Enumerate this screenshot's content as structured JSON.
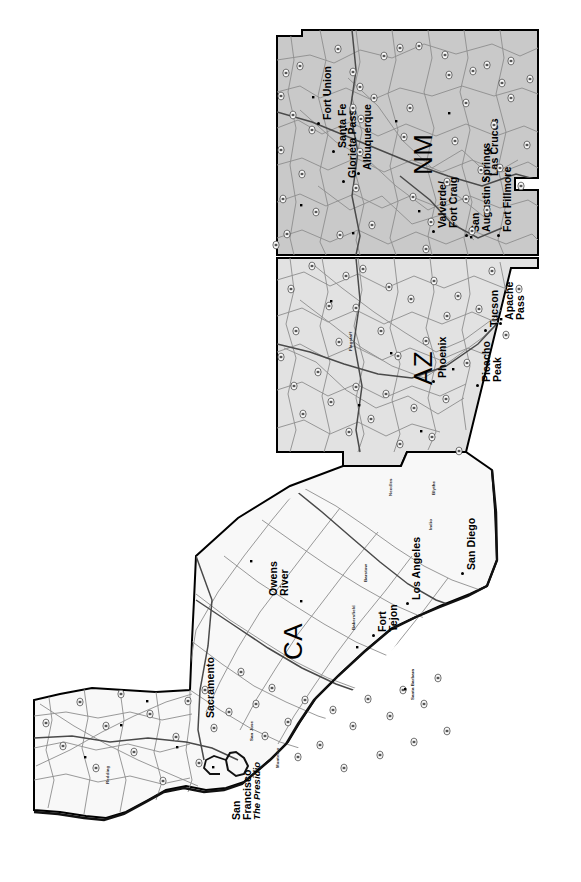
{
  "map": {
    "title": "Southwest States Historic Route Map",
    "projection_note": "rotated 90 degrees counter-clockwise",
    "background_color": "#ffffff",
    "colors": {
      "new_mexico_fill": "#c9c9c9",
      "arizona_fill": "#e2e2e2",
      "california_fill": "#f7f7f7",
      "state_border": "#000000",
      "road": "#8d8d8d",
      "major_road": "#4a4a4a",
      "shield_fill": "#ffffff",
      "label_color": "#000000"
    },
    "states": [
      {
        "code": "NM",
        "name": "New Mexico",
        "label": "NM",
        "fill": "#c9c9c9"
      },
      {
        "code": "AZ",
        "name": "Arizona",
        "label": "AZ",
        "fill": "#e2e2e2"
      },
      {
        "code": "CA",
        "name": "California",
        "label": "CA",
        "fill": "#f7f7f7"
      }
    ],
    "state_labels": [
      {
        "id": "nm-label",
        "text": "NM",
        "x": 410,
        "y": 175
      },
      {
        "id": "az-label",
        "text": "AZ",
        "x": 410,
        "y": 385
      },
      {
        "id": "ca-label",
        "text": "CA",
        "x": 280,
        "y": 660
      }
    ],
    "city_labels": [
      {
        "id": "fort-union",
        "text": "Fort Union",
        "state": "NM",
        "x": 322,
        "y": 120,
        "marker": true
      },
      {
        "id": "santa-fe",
        "text": "Santa Fe",
        "state": "NM",
        "x": 337,
        "y": 148,
        "marker": true
      },
      {
        "id": "glorieta-pass",
        "text": "Glorieta Pass",
        "state": "NM",
        "x": 347,
        "y": 178,
        "marker": true
      },
      {
        "id": "albuquerque",
        "text": "Albuquerque",
        "state": "NM",
        "x": 362,
        "y": 170,
        "marker": true
      },
      {
        "id": "valverde-fort-craig",
        "text": "Valverde/",
        "text2": "Fort Craig",
        "state": "NM",
        "x": 437,
        "y": 228,
        "marker": true
      },
      {
        "id": "san-augustin-springs",
        "text": "San",
        "text2": "Augustin Springs",
        "state": "NM",
        "x": 470,
        "y": 232,
        "marker": true
      },
      {
        "id": "las-cruces",
        "text": "Las Cruces",
        "state": "NM",
        "x": 489,
        "y": 176,
        "marker": true
      },
      {
        "id": "fort-fillmore",
        "text": "Fort Fillmore",
        "state": "NM",
        "x": 502,
        "y": 232,
        "marker": true
      },
      {
        "id": "flagstaff",
        "text": "Flagstaff",
        "state": "AZ",
        "x": 349,
        "y": 351,
        "minor": true
      },
      {
        "id": "phoenix",
        "text": "Phoenix",
        "state": "AZ",
        "x": 437,
        "y": 378,
        "marker": true
      },
      {
        "id": "tucson",
        "text": "Tucson",
        "state": "AZ",
        "x": 489,
        "y": 327,
        "marker": true
      },
      {
        "id": "apache-pass",
        "text": "Apache",
        "text2": "Pass",
        "state": "AZ",
        "x": 504,
        "y": 320,
        "marker": true
      },
      {
        "id": "picacho-peak",
        "text": "Picacho",
        "text2": "Peak",
        "state": "AZ",
        "x": 481,
        "y": 382,
        "marker": true
      },
      {
        "id": "needles",
        "text": "Needles",
        "state": "CA",
        "x": 389,
        "y": 496,
        "minor": true
      },
      {
        "id": "blythe",
        "text": "Blythe",
        "state": "CA",
        "x": 432,
        "y": 495,
        "minor": true
      },
      {
        "id": "indio",
        "text": "Indio",
        "state": "CA",
        "x": 429,
        "y": 530,
        "minor": true
      },
      {
        "id": "san-diego",
        "text": "San Diego",
        "state": "CA",
        "x": 466,
        "y": 570,
        "marker": true
      },
      {
        "id": "los-angeles",
        "text": "Los Angeles",
        "state": "CA",
        "x": 411,
        "y": 600,
        "marker": true
      },
      {
        "id": "barstow",
        "text": "Barstow",
        "state": "CA",
        "x": 364,
        "y": 582,
        "minor": true
      },
      {
        "id": "owens-river",
        "text": "Owens",
        "text2": "River",
        "state": "CA",
        "x": 268,
        "y": 596,
        "marker": false
      },
      {
        "id": "bakersfield",
        "text": "Bakersfield",
        "state": "CA",
        "x": 352,
        "y": 630,
        "minor": true
      },
      {
        "id": "fort-tejon",
        "text": "Fort",
        "text2": "Tejon",
        "state": "CA",
        "x": 377,
        "y": 632,
        "marker": true
      },
      {
        "id": "santa-barbara",
        "text": "Santa Barbara",
        "state": "CA",
        "x": 411,
        "y": 700,
        "minor": true
      },
      {
        "id": "sacramento",
        "text": "Sacramento",
        "state": "CA",
        "x": 205,
        "y": 718,
        "marker": false
      },
      {
        "id": "san-jose",
        "text": "San Jose",
        "state": "CA",
        "x": 250,
        "y": 741,
        "minor": true
      },
      {
        "id": "monterey",
        "text": "Monterey",
        "state": "CA",
        "x": 276,
        "y": 768,
        "minor": true
      },
      {
        "id": "redding",
        "text": "Redding",
        "state": "CA",
        "x": 106,
        "y": 784,
        "minor": true
      },
      {
        "id": "san-francisco",
        "text": "San",
        "text2": "Francisco",
        "sub": "The Presidio",
        "state": "CA",
        "x": 231,
        "y": 820,
        "marker": false
      }
    ],
    "route_shields": [
      {
        "x": 286,
        "y": 73
      },
      {
        "x": 300,
        "y": 66
      },
      {
        "x": 338,
        "y": 49
      },
      {
        "x": 353,
        "y": 72
      },
      {
        "x": 360,
        "y": 87
      },
      {
        "x": 384,
        "y": 56
      },
      {
        "x": 400,
        "y": 48
      },
      {
        "x": 419,
        "y": 46
      },
      {
        "x": 445,
        "y": 55
      },
      {
        "x": 449,
        "y": 75
      },
      {
        "x": 473,
        "y": 71
      },
      {
        "x": 487,
        "y": 65
      },
      {
        "x": 502,
        "y": 83
      },
      {
        "x": 511,
        "y": 61
      },
      {
        "x": 530,
        "y": 79
      },
      {
        "x": 281,
        "y": 96
      },
      {
        "x": 293,
        "y": 115
      },
      {
        "x": 312,
        "y": 130
      },
      {
        "x": 353,
        "y": 108
      },
      {
        "x": 361,
        "y": 119
      },
      {
        "x": 360,
        "y": 152
      },
      {
        "x": 374,
        "y": 98
      },
      {
        "x": 404,
        "y": 137
      },
      {
        "x": 410,
        "y": 108
      },
      {
        "x": 455,
        "y": 141
      },
      {
        "x": 466,
        "y": 103
      },
      {
        "x": 481,
        "y": 170
      },
      {
        "x": 494,
        "y": 125
      },
      {
        "x": 511,
        "y": 98
      },
      {
        "x": 527,
        "y": 145
      },
      {
        "x": 281,
        "y": 150
      },
      {
        "x": 283,
        "y": 199
      },
      {
        "x": 287,
        "y": 234
      },
      {
        "x": 302,
        "y": 174
      },
      {
        "x": 316,
        "y": 212
      },
      {
        "x": 340,
        "y": 235
      },
      {
        "x": 356,
        "y": 188
      },
      {
        "x": 372,
        "y": 225
      },
      {
        "x": 413,
        "y": 197
      },
      {
        "x": 426,
        "y": 249
      },
      {
        "x": 431,
        "y": 222
      },
      {
        "x": 447,
        "y": 182
      },
      {
        "x": 466,
        "y": 199
      },
      {
        "x": 472,
        "y": 231
      },
      {
        "x": 487,
        "y": 210
      },
      {
        "x": 500,
        "y": 168
      },
      {
        "x": 521,
        "y": 186
      },
      {
        "x": 276,
        "y": 245
      },
      {
        "x": 291,
        "y": 289
      },
      {
        "x": 296,
        "y": 331
      },
      {
        "x": 312,
        "y": 266
      },
      {
        "x": 329,
        "y": 306
      },
      {
        "x": 339,
        "y": 342
      },
      {
        "x": 346,
        "y": 276
      },
      {
        "x": 356,
        "y": 308
      },
      {
        "x": 363,
        "y": 269
      },
      {
        "x": 381,
        "y": 331
      },
      {
        "x": 389,
        "y": 287
      },
      {
        "x": 398,
        "y": 356
      },
      {
        "x": 411,
        "y": 299
      },
      {
        "x": 426,
        "y": 341
      },
      {
        "x": 434,
        "y": 281
      },
      {
        "x": 447,
        "y": 316
      },
      {
        "x": 458,
        "y": 296
      },
      {
        "x": 467,
        "y": 363
      },
      {
        "x": 479,
        "y": 309
      },
      {
        "x": 492,
        "y": 271
      },
      {
        "x": 506,
        "y": 335
      },
      {
        "x": 519,
        "y": 289
      },
      {
        "x": 281,
        "y": 357
      },
      {
        "x": 294,
        "y": 386
      },
      {
        "x": 303,
        "y": 414
      },
      {
        "x": 318,
        "y": 372
      },
      {
        "x": 331,
        "y": 402
      },
      {
        "x": 349,
        "y": 432
      },
      {
        "x": 356,
        "y": 387
      },
      {
        "x": 371,
        "y": 419
      },
      {
        "x": 386,
        "y": 394
      },
      {
        "x": 400,
        "y": 444
      },
      {
        "x": 414,
        "y": 408
      },
      {
        "x": 432,
        "y": 437
      },
      {
        "x": 446,
        "y": 399
      },
      {
        "x": 459,
        "y": 451
      },
      {
        "x": 205,
        "y": 690
      },
      {
        "x": 229,
        "y": 712
      },
      {
        "x": 241,
        "y": 672
      },
      {
        "x": 256,
        "y": 704
      },
      {
        "x": 265,
        "y": 736
      },
      {
        "x": 272,
        "y": 688
      },
      {
        "x": 288,
        "y": 722
      },
      {
        "x": 298,
        "y": 757
      },
      {
        "x": 305,
        "y": 700
      },
      {
        "x": 320,
        "y": 745
      },
      {
        "x": 333,
        "y": 710
      },
      {
        "x": 344,
        "y": 768
      },
      {
        "x": 353,
        "y": 726
      },
      {
        "x": 368,
        "y": 699
      },
      {
        "x": 380,
        "y": 755
      },
      {
        "x": 390,
        "y": 716
      },
      {
        "x": 403,
        "y": 690
      },
      {
        "x": 414,
        "y": 742
      },
      {
        "x": 424,
        "y": 704
      },
      {
        "x": 438,
        "y": 678
      },
      {
        "x": 447,
        "y": 731
      },
      {
        "x": 46,
        "y": 723
      },
      {
        "x": 63,
        "y": 746
      },
      {
        "x": 80,
        "y": 702
      },
      {
        "x": 96,
        "y": 768
      },
      {
        "x": 106,
        "y": 726
      },
      {
        "x": 121,
        "y": 694
      },
      {
        "x": 134,
        "y": 752
      },
      {
        "x": 150,
        "y": 714
      },
      {
        "x": 163,
        "y": 781
      },
      {
        "x": 176,
        "y": 737
      },
      {
        "x": 188,
        "y": 701
      },
      {
        "x": 199,
        "y": 763
      },
      {
        "x": 214,
        "y": 728
      }
    ]
  }
}
